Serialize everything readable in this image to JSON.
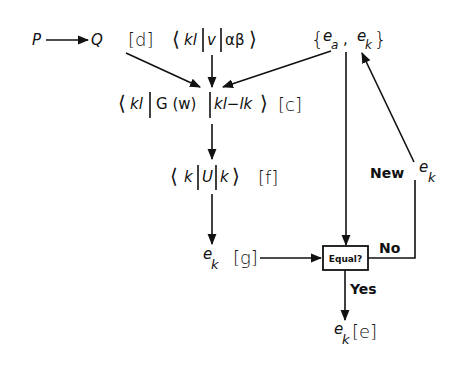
{
  "diagram": {
    "nodes": {
      "p": "P",
      "q": "Q",
      "d_label": "[d]",
      "matrix_v": {
        "open": "⟨",
        "bra": "kl",
        "op": "v",
        "ket": "αβ",
        "close": "⟩"
      },
      "energies": {
        "open": "{",
        "e_a": "e",
        "e_a_sub": "a",
        "comma": ",",
        "e_k": "e",
        "e_k_sub": "k",
        "close": "}"
      },
      "matrix_g": {
        "open": "⟨",
        "bra": "kl",
        "op": "G (w)",
        "ket": "kl−lk",
        "close": "⟩",
        "label": "[c]"
      },
      "matrix_u": {
        "open": "⟨",
        "bra": "k",
        "op": "U",
        "ket": "k",
        "close": "⟩",
        "label": "[f]"
      },
      "ek_g": {
        "e": "e",
        "sub": "k",
        "label": "[g]"
      },
      "decision": "Equal?",
      "ek_e": {
        "e": "e",
        "sub": "k",
        "label": "[e]"
      },
      "new_ek": {
        "text": "New",
        "e": "e",
        "sub": "k"
      }
    },
    "edges": {
      "yes": "Yes",
      "no": "No"
    },
    "colors": {
      "ink": "#111111",
      "background": "#ffffff"
    }
  }
}
